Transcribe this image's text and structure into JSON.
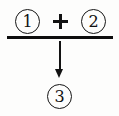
{
  "diagram": {
    "type": "reaction-combination",
    "background_color": "#fdfdfc",
    "ink_color": "#121212",
    "inputs": [
      {
        "id": "term-1",
        "label": "①",
        "plain": "1",
        "style": "circled-number"
      },
      {
        "id": "term-2",
        "label": "②",
        "plain": "2",
        "style": "circled-number"
      }
    ],
    "operator": {
      "name": "plus-operator",
      "label": "+"
    },
    "divider": {
      "name": "divider-rule",
      "label": ""
    },
    "arrow": {
      "name": "down-arrow",
      "direction": "down",
      "label": ""
    },
    "output": {
      "id": "term-3",
      "label": "③",
      "plain": "3",
      "style": "circled-number"
    },
    "expression": "① + ② → ③"
  }
}
